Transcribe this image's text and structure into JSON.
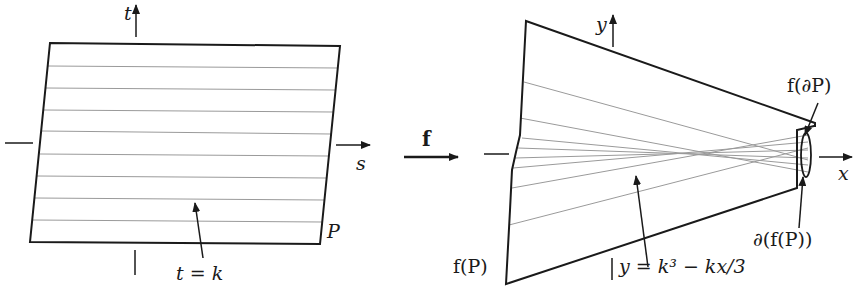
{
  "left_panel": {
    "axis_t_label": "t",
    "axis_s_label": "s",
    "region_label": "P",
    "line_label": "t = k",
    "line_count": 8
  },
  "map": {
    "arrow_label": "f"
  },
  "right_panel": {
    "axis_y_label": "y",
    "axis_x_label": "x",
    "image_label": "f(P)",
    "image_of_boundary_label": "f(∂P)",
    "boundary_of_image_label": "∂(f(P))",
    "curve_label": "y = k³ − kx/3"
  },
  "colors": {
    "ink": "#1a1a1a",
    "grid_lines": "#9a9a9a",
    "background": "#ffffff"
  }
}
